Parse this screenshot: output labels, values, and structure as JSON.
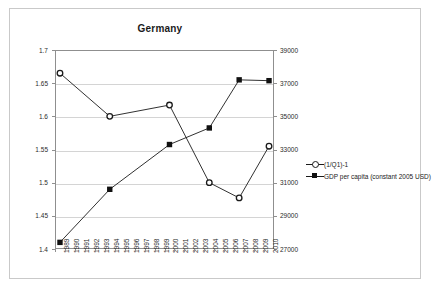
{
  "chart_data": {
    "type": "line",
    "title": "Germany",
    "xlabel": "",
    "ylabel": "",
    "grid": true,
    "legend_position": "right",
    "categories": [
      "1989",
      "1990",
      "1991",
      "1992",
      "1993",
      "1994",
      "1995",
      "1996",
      "1997",
      "1998",
      "1999",
      "2000",
      "2001",
      "2002",
      "2003",
      "2004",
      "2005",
      "2006",
      "2007",
      "2008",
      "2009",
      "2010"
    ],
    "left_axis": {
      "ticks": [
        "1.4",
        "1.45",
        "1.5",
        "1.55",
        "1.6",
        "1.65",
        "1.7"
      ],
      "min": 1.4,
      "max": 1.7,
      "step": 0.05
    },
    "right_axis": {
      "ticks": [
        "27000",
        "29000",
        "31000",
        "33000",
        "35000",
        "37000",
        "39000"
      ],
      "min": 27000,
      "max": 39000,
      "step": 2000
    },
    "series": [
      {
        "name": "(1/Q1)-1",
        "axis": "left",
        "marker": "open-circle",
        "points": [
          {
            "x": "1989",
            "y": 1.665
          },
          {
            "x": "1994",
            "y": 1.6
          },
          {
            "x": "2000",
            "y": 1.617
          },
          {
            "x": "2004",
            "y": 1.5
          },
          {
            "x": "2007",
            "y": 1.477
          },
          {
            "x": "2010",
            "y": 1.555
          }
        ]
      },
      {
        "name": "GDP per capita (constant 2005 USD)",
        "axis": "right",
        "marker": "filled-square",
        "points": [
          {
            "x": "1989",
            "y": 27400
          },
          {
            "x": "1994",
            "y": 30600
          },
          {
            "x": "2000",
            "y": 33300
          },
          {
            "x": "2004",
            "y": 34300
          },
          {
            "x": "2007",
            "y": 37200
          },
          {
            "x": "2010",
            "y": 37150
          }
        ]
      }
    ],
    "colors": {
      "series_line": "#1a1a1a",
      "gridline": "#d4d4d4",
      "axis": "#8f8f8f",
      "text": "#2b2b2b",
      "background": "#ffffff",
      "border": "#c9c9c9"
    }
  }
}
